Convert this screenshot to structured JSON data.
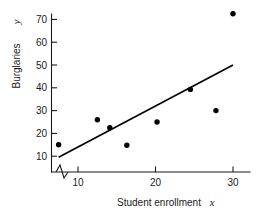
{
  "chart_data": {
    "type": "scatter",
    "title": "",
    "subtitle": "",
    "xlabel": "Student enrollment",
    "xlabel_variable": "x",
    "ylabel": "Burglaries",
    "ylabel_variable": "y",
    "xlim": [
      7,
      31
    ],
    "ylim": [
      6,
      76
    ],
    "x_ticks": [
      10,
      20,
      30
    ],
    "x_tick_labels": [
      "10",
      "20",
      "30"
    ],
    "y_ticks": [
      10,
      20,
      30,
      40,
      50,
      60,
      70
    ],
    "y_tick_labels": [
      "10",
      "20",
      "30",
      "40",
      "50",
      "60",
      "70"
    ],
    "grid": false,
    "legend": false,
    "legend_position": "none",
    "axis_break_x": true,
    "point_color": "#000000",
    "line_color": "#000000",
    "x": [
      7.5,
      12.5,
      14.1,
      16.3,
      20.2,
      24.5,
      27.8,
      30.0
    ],
    "y": [
      15.0,
      26.0,
      22.5,
      14.8,
      25.0,
      39.3,
      30.0,
      72.5
    ],
    "points": [
      {
        "x": 7.5,
        "y": 15.0
      },
      {
        "x": 12.5,
        "y": 26.0
      },
      {
        "x": 14.1,
        "y": 22.5
      },
      {
        "x": 16.3,
        "y": 14.8
      },
      {
        "x": 20.2,
        "y": 25.0
      },
      {
        "x": 24.5,
        "y": 39.3
      },
      {
        "x": 27.8,
        "y": 30.0
      },
      {
        "x": 30.0,
        "y": 72.5
      }
    ],
    "trendline": {
      "name": "least-squares regression line",
      "x0": 7.5,
      "y0": 9.5,
      "x1": 30.0,
      "y1": 50.0
    }
  }
}
